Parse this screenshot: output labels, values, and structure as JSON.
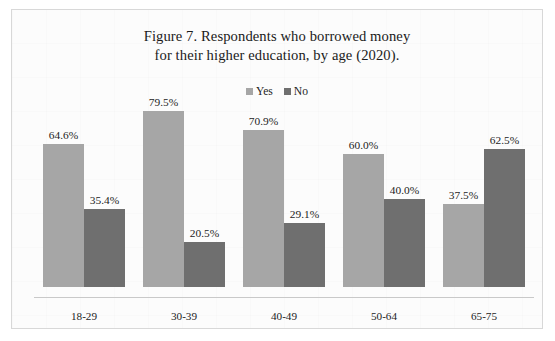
{
  "figure": {
    "title_line_1": "Figure 7. Respondents who borrowed money",
    "title_line_2": "for their higher education, by age (2020)."
  },
  "legend": {
    "position": "top",
    "entries": [
      {
        "label": "Yes",
        "color": "#a6a6a6",
        "icon": "legend-square-icon"
      },
      {
        "label": "No",
        "color": "#6f6f6f",
        "icon": "legend-square-icon"
      }
    ]
  },
  "colors": {
    "yes_bar": "#a6a6a6",
    "no_bar": "#6f6f6f",
    "frame_border": "#d8d8d8",
    "axis_line": "#c9c9c9",
    "plot_background": "#fcfcfc",
    "text": "#1c1c1c"
  },
  "chart_data": {
    "type": "bar",
    "title": "Figure 7. Respondents who borrowed money for their higher education, by age (2020).",
    "xlabel": "",
    "ylabel": "",
    "ylim": [
      0,
      85
    ],
    "grid": false,
    "legend_position": "top",
    "categories": [
      "18-29",
      "30-39",
      "40-49",
      "50-64",
      "65-75"
    ],
    "series": [
      {
        "name": "Yes",
        "color": "#a6a6a6",
        "values": [
          64.6,
          79.5,
          70.9,
          60.0,
          37.5
        ],
        "labels": [
          "64.6%",
          "79.5%",
          "70.9%",
          "60.0%",
          "37.5%"
        ]
      },
      {
        "name": "No",
        "color": "#6f6f6f",
        "values": [
          35.4,
          20.5,
          29.1,
          40.0,
          62.5
        ],
        "labels": [
          "35.4%",
          "20.5%",
          "29.1%",
          "40.0%",
          "62.5%"
        ]
      }
    ]
  }
}
